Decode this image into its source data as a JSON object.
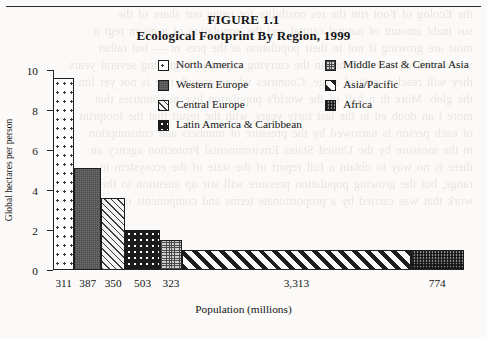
{
  "figure": {
    "title_line1": "FIGURE 1.1",
    "title_line2": "Ecological Footprint By Region, 1999"
  },
  "legend": {
    "left_column": [
      {
        "label": "North America",
        "pattern": "pat-dots-sparse"
      },
      {
        "label": "Western Europe",
        "pattern": "pat-solid-gray"
      },
      {
        "label": "Central Europe",
        "pattern": "pat-hatch-fine"
      },
      {
        "label": "Latin America & Caribbean",
        "pattern": "pat-dots-bold"
      }
    ],
    "right_column": [
      {
        "label": "Middle East & Central Asia",
        "pattern": "pat-grid-fine"
      },
      {
        "label": "Asia/Pacific",
        "pattern": "pat-stripes-bold"
      },
      {
        "label": "Africa",
        "pattern": "pat-checker"
      }
    ]
  },
  "chart_data": {
    "type": "bar",
    "title": "Ecological Footprint By Region, 1999",
    "subtitle": "FIGURE 1.1",
    "xlabel": "Population (millions)",
    "ylabel": "Global hectares per person",
    "ylim": [
      0,
      10
    ],
    "yticks": [
      "0",
      "2",
      "4",
      "6",
      "8",
      "10"
    ],
    "grid": false,
    "legend_position": "top-right",
    "note": "Bar width is proportional to population; bar height is global hectares per person.",
    "categories": [
      "North America",
      "Western Europe",
      "Central Europe",
      "Latin America & Caribbean",
      "Middle East & Central Asia",
      "Asia/Pacific",
      "Africa"
    ],
    "values": [
      9.6,
      5.1,
      3.6,
      2.0,
      1.5,
      1.0,
      1.0
    ],
    "widths_population_millions": [
      311,
      387,
      350,
      503,
      323,
      3313,
      774
    ],
    "population_labels": [
      "311",
      "387",
      "350",
      "503",
      "323",
      "3,313",
      "774"
    ],
    "patterns": [
      "pat-dots-sparse",
      "pat-solid-gray",
      "pat-hatch-fine",
      "pat-dots-bold",
      "pat-grid-fine",
      "pat-stripes-bold",
      "pat-checker"
    ]
  },
  "bleed_text": [
    "the Ecolog of Foot rint the res onsibility for using our share of the",
    "sus inabl amount of natural capital and the population of a given regi n",
    "most are growing if not in their population at the pres nt — but rather",
    "year at wh ch rate it is not in the carrying capacity. Beginning several years",
    "they will reach a critical stage. Countries whose growth rate is not yet lim",
    "the glob. More th n half of the world's population live in countries that",
    "more t an doub ed in the last forty years, with the result that the footprint",
    "of each person is narrowed by the pressure of numbers and consumption",
    "in the measure by the United States Environmental Protection agency an",
    "there is no way to obtain a full report of the state of the ecosystem in",
    "range, but the growing population pressure will stir up attention to the EPA",
    "work that was carried by a proportionate terms and components of"
  ]
}
